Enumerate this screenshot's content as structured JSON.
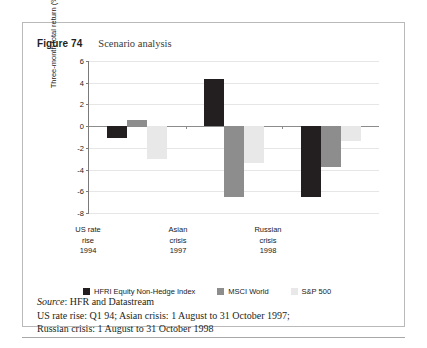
{
  "figure": {
    "label": "Figure 74",
    "title": "Scenario analysis"
  },
  "chart_data": {
    "type": "bar",
    "title": "Scenario analysis",
    "xlabel": "",
    "ylabel": "Three-month total return (%)",
    "ylim": [
      -8,
      6
    ],
    "yticks": [
      6,
      4,
      2,
      0,
      -2,
      -4,
      -6,
      -8
    ],
    "grid": true,
    "legend_position": "bottom",
    "categories": [
      "US rate rise 1994",
      "Asian crisis 1997",
      "Russian crisis 1998"
    ],
    "category_lines": [
      [
        "US rate",
        "rise",
        "1994"
      ],
      [
        "Asian",
        "crisis",
        "1997"
      ],
      [
        "Russian",
        "crisis",
        "1998"
      ]
    ],
    "series": [
      {
        "name": "HFRI Equity Non-Hedge Index",
        "color": "#231f20",
        "values": [
          -1.1,
          4.3,
          -6.5
        ]
      },
      {
        "name": "MSCI World",
        "color": "#8d8d8d",
        "values": [
          0.6,
          -6.5,
          -3.8
        ]
      },
      {
        "name": "S&P 500",
        "color": "#e8e8e8",
        "values": [
          -3.0,
          -3.4,
          -1.4
        ]
      }
    ]
  },
  "axis": {
    "ytick_0": "6",
    "ytick_1": "4",
    "ytick_2": "2",
    "ytick_3": "0",
    "ytick_4": "-2",
    "ytick_5": "-4",
    "ytick_6": "-6",
    "ytick_7": "-8",
    "ylabel": "Three-month total return (%)"
  },
  "categories": {
    "c0_l0": "US rate",
    "c0_l1": "rise",
    "c0_l2": "1994",
    "c1_l0": "Asian",
    "c1_l1": "crisis",
    "c1_l2": "1997",
    "c2_l0": "Russian",
    "c2_l1": "crisis",
    "c2_l2": "1998"
  },
  "legend": {
    "item0": "HFRI Equity Non-Hedge Index",
    "item1": "MSCI World",
    "item2": "S&P 500"
  },
  "footnote": {
    "source_word": "Source",
    "source_text": ": HFR and Datastream",
    "line2": "US rate rise: Q1 94; Asian crisis: 1 August to 31 October 1997;",
    "line3": "Russian crisis: 1 August to 31 October 1998"
  },
  "colors": {
    "series1": "#231f20",
    "series2": "#8d8d8d",
    "series3": "#e8e8e8",
    "grid": "#e6e6e6",
    "axis": "#8c8c8c",
    "border": "#b9b9b9"
  }
}
